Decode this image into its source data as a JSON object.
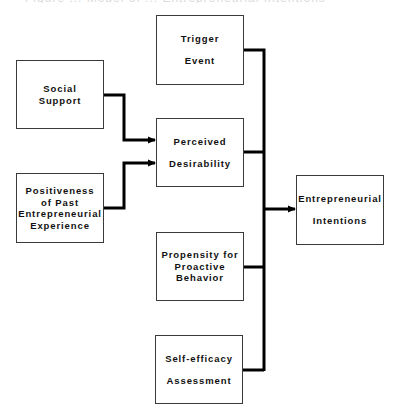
{
  "caption": "Figure ... Model of ... Entrepreneurial Intentions",
  "nodes": {
    "trigger_event": {
      "lines": [
        "Trigger",
        "Event"
      ]
    },
    "social_support": {
      "lines": [
        "Social",
        "Support"
      ]
    },
    "perceived_desirability": {
      "lines": [
        "Perceived",
        "Desirability"
      ]
    },
    "positiveness": {
      "lines": [
        "Positiveness",
        "of Past",
        "Entrepreneurial",
        "Experience"
      ]
    },
    "entrepreneurial_intentions": {
      "lines": [
        "Entrepreneurial",
        "Intentions"
      ]
    },
    "propensity": {
      "lines": [
        "Propensity for",
        "Proactive",
        "Behavior"
      ]
    },
    "self_efficacy": {
      "lines": [
        "Self-efficacy",
        "Assessment"
      ]
    }
  },
  "edges": [
    {
      "from": "Social Support",
      "to": "Perceived Desirability"
    },
    {
      "from": "Positiveness of Past Entrepreneurial Experience",
      "to": "Perceived Desirability"
    },
    {
      "from": "Trigger Event",
      "to": "Entrepreneurial Intentions"
    },
    {
      "from": "Perceived Desirability",
      "to": "Entrepreneurial Intentions"
    },
    {
      "from": "Propensity for Proactive Behavior",
      "to": "Entrepreneurial Intentions"
    },
    {
      "from": "Self-efficacy Assessment",
      "to": "Entrepreneurial Intentions"
    }
  ],
  "colors": {
    "line": "#000000",
    "box_border": "#3a3a3a",
    "text": "#111111"
  }
}
